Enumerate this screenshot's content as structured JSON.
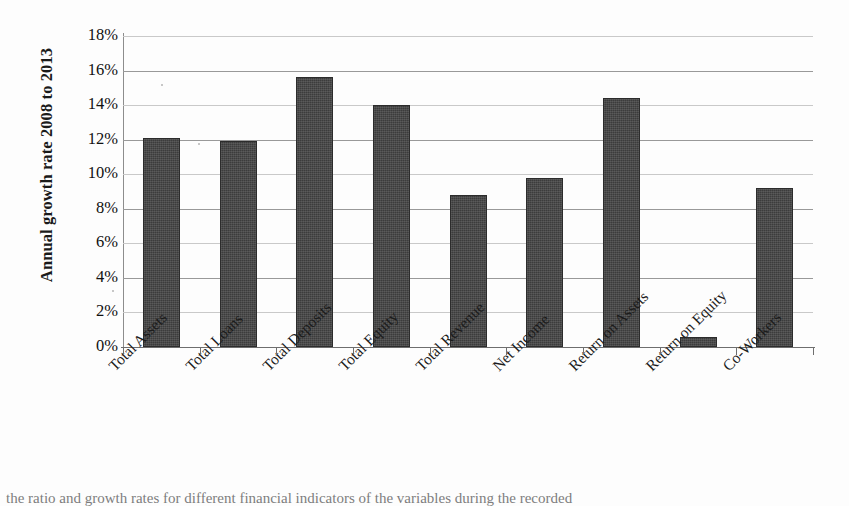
{
  "chart_data": {
    "type": "bar",
    "title": "",
    "xlabel": "",
    "ylabel": "Annual growth rate 2008 to 2013",
    "categories": [
      "Total Assets",
      "Total Loans",
      "Total Deposits",
      "Total Equity",
      "Total Revenue",
      "Net Income",
      "Return on Assets",
      "Return on Equity",
      "Co-Workers"
    ],
    "values": [
      12.1,
      11.9,
      15.6,
      14.0,
      8.8,
      9.8,
      14.4,
      0.55,
      9.2
    ],
    "value_labels": [
      "12.1%",
      "11.9%",
      "15.6%",
      "14.0%",
      "8.8%",
      "9.8%",
      "14.4%",
      "0.6%",
      "9.2%"
    ],
    "ylim": [
      0,
      18
    ],
    "ytick_values": [
      0,
      2,
      4,
      6,
      8,
      10,
      12,
      14,
      16,
      18
    ],
    "ytick_labels": [
      "0%",
      "2%",
      "4%",
      "6%",
      "8%",
      "10%",
      "12%",
      "14%",
      "16%",
      "18%"
    ],
    "units": "percent",
    "grid": true,
    "legend": "none",
    "bar_color": "#3c3c3c",
    "gridline_color": "#999999",
    "axis_color": "#6e6e6e"
  },
  "caption": {
    "partial_line": "the ratio and growth rates for different financial indicators of the variables during the recorded"
  }
}
